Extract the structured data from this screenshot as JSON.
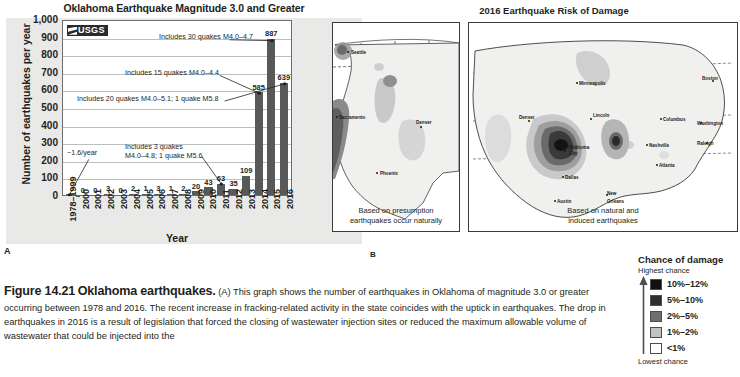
{
  "panel_a": {
    "label": "A",
    "chart_data": {
      "type": "bar",
      "title": "Oklahoma Earthquake Magnitude 3.0 and Greater",
      "xlabel": "Year",
      "ylabel": "Number of earthquakes per year",
      "ylim": [
        0,
        1000
      ],
      "ytick_labels": [
        "1,000",
        "900",
        "800",
        "700",
        "600",
        "500",
        "400",
        "300",
        "200",
        "100",
        "0"
      ],
      "ytick_values": [
        1000,
        900,
        800,
        700,
        600,
        500,
        400,
        300,
        200,
        100,
        0
      ],
      "grid": true,
      "legend": "none",
      "source_logo": "USGS",
      "categories": [
        "1978–1999",
        "2000",
        "2001",
        "2002",
        "2003",
        "2004",
        "2005",
        "2006",
        "2007",
        "2008",
        "2009",
        "2010",
        "2011",
        "2012",
        "2013",
        "2014",
        "2015",
        "2016"
      ],
      "values": [
        1.6,
        0,
        0,
        3,
        0,
        2,
        1,
        3,
        1,
        2,
        20,
        43,
        63,
        35,
        109,
        585,
        887,
        639
      ],
      "value_labels": [
        "",
        "0",
        "0",
        "3",
        "0",
        "2",
        "1",
        "3",
        "1",
        "2",
        "20",
        "43",
        "63",
        "35",
        "109",
        "585",
        "887",
        "639"
      ],
      "annotations": [
        {
          "id": "rate",
          "text": "~1.6/year",
          "points_to": "1978–1999"
        },
        {
          "id": "a2011",
          "line1": "Includes 3 quakes",
          "line2": "M4.0–4.8; 1 quake M5.6",
          "points_to": "2011"
        },
        {
          "id": "a2015",
          "text": "Includes 30 quakes M4.0–4.7",
          "points_to": "2015"
        },
        {
          "id": "a2014",
          "text": "Includes 15 quakes M4.0–4.4",
          "points_to": "2014"
        },
        {
          "id": "a2016",
          "text": "Includes 20 quakes M4.0–5.1; 1 quake M5.8",
          "points_to": "2016"
        }
      ]
    }
  },
  "panel_b": {
    "label": "B",
    "title": "2016 Earthquake Risk of Damage",
    "map_left": {
      "caption_line1": "Based on presumption",
      "caption_line2": "earthquakes occur naturally",
      "cities": [
        "Seattle",
        "Sacramento",
        "Denver",
        "Phoenix"
      ]
    },
    "map_right": {
      "caption_line1": "Based on natural and",
      "caption_line2": "induced earthquakes",
      "cities": [
        "Minneapolis",
        "Boston",
        "Lincoln",
        "Columbus",
        "Washington",
        "Denver",
        "Nashville",
        "Raleigh",
        "Oklahoma City",
        "Atlanta",
        "Dallas",
        "Austin",
        "New Orleans"
      ]
    }
  },
  "legend": {
    "title": "Chance of damage",
    "high_label": "Highest chance",
    "low_label": "Lowest chance",
    "items": [
      {
        "label": "10%–12%",
        "color": "#111111"
      },
      {
        "label": "5%–10%",
        "color": "#2f2f2f"
      },
      {
        "label": "2%–5%",
        "color": "#6e6e6e"
      },
      {
        "label": "1%–2%",
        "color": "#c2c2c2"
      },
      {
        "label": "<1%",
        "color": "#ffffff"
      }
    ]
  },
  "caption": {
    "figure_number": "Figure 14.21",
    "figure_title": "Oklahoma earthquakes.",
    "body": "(A) This graph shows the number of earthquakes in Oklahoma of magnitude 3.0 or greater occurring between 1978 and 2016. The recent increase in fracking-related activity in the state coincides with the uptick in earthquakes. The drop in earthquakes in 2016 is a result of legislation that forced the closing of wastewater injection sites or reduced the maximum allowable volume of wastewater that could be injected into the"
  }
}
